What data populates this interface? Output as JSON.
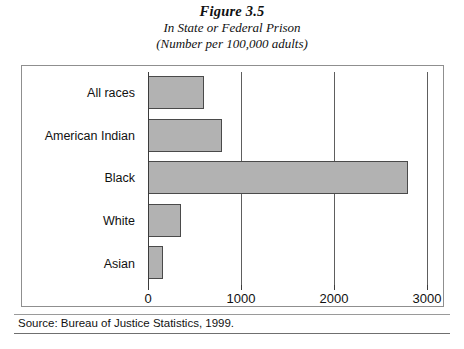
{
  "figure": {
    "title": "Figure 3.5",
    "subtitle_1": "In State or Federal Prison",
    "subtitle_2": "(Number per 100,000 adults)"
  },
  "source": {
    "text": "Source: Bureau of Justice Statistics, 1999."
  },
  "chart_data": {
    "type": "bar",
    "orientation": "horizontal",
    "title": "Figure 3.5",
    "subtitle": "In State or Federal Prison (Number per 100,000 adults)",
    "categories": [
      "All races",
      "American Indian",
      "Black",
      "White",
      "Asian"
    ],
    "values": [
      600,
      800,
      2800,
      350,
      160
    ],
    "xlabel": "",
    "ylabel": "",
    "xlim": [
      0,
      3000
    ],
    "xticks": [
      0,
      1000,
      2000,
      3000
    ],
    "xtick_labels": [
      "0",
      "1000",
      "2000",
      "3000"
    ],
    "grid": true,
    "grid_axis": "x",
    "legend": false,
    "bar_color": "#b2b2b2",
    "bar_edge_color": "#4a4a4a"
  }
}
